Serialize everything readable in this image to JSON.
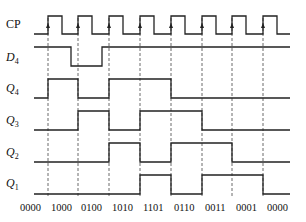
{
  "diagram": {
    "type": "timing",
    "signals": [
      {
        "name": "CP",
        "sub": "",
        "italic": false,
        "y_high": 16,
        "y_low": 34,
        "label_y": 28
      },
      {
        "name": "D",
        "sub": "4",
        "italic": true,
        "y_high": 47,
        "y_low": 66,
        "label_y": 61
      },
      {
        "name": "Q",
        "sub": "4",
        "italic": true,
        "y_high": 79,
        "y_low": 98,
        "label_y": 92
      },
      {
        "name": "Q",
        "sub": "3",
        "italic": true,
        "y_high": 111,
        "y_low": 130,
        "label_y": 124
      },
      {
        "name": "Q",
        "sub": "2",
        "italic": true,
        "y_high": 143,
        "y_low": 162,
        "label_y": 156
      },
      {
        "name": "Q",
        "sub": "1",
        "italic": true,
        "y_high": 175,
        "y_low": 194,
        "label_y": 187
      }
    ],
    "clock_edges_x": [
      48,
      78,
      109,
      140,
      171,
      202,
      232,
      263
    ],
    "pulse_width": 14,
    "x_start": 34,
    "x_end": 290,
    "waveforms": {
      "D4": [
        [
          34,
          1
        ],
        [
          71,
          0
        ],
        [
          102,
          1
        ],
        [
          290,
          1
        ]
      ],
      "Q4": [
        [
          34,
          0
        ],
        [
          48,
          1
        ],
        [
          78,
          0
        ],
        [
          109,
          1
        ],
        [
          171,
          0
        ],
        [
          290,
          0
        ]
      ],
      "Q3": [
        [
          34,
          0
        ],
        [
          78,
          1
        ],
        [
          109,
          0
        ],
        [
          140,
          1
        ],
        [
          202,
          0
        ],
        [
          290,
          0
        ]
      ],
      "Q2": [
        [
          34,
          0
        ],
        [
          109,
          1
        ],
        [
          140,
          0
        ],
        [
          171,
          1
        ],
        [
          232,
          0
        ],
        [
          290,
          0
        ]
      ],
      "Q1": [
        [
          34,
          0
        ],
        [
          140,
          1
        ],
        [
          171,
          0
        ],
        [
          202,
          1
        ],
        [
          263,
          0
        ],
        [
          290,
          0
        ]
      ]
    },
    "states": [
      "0000",
      "1000",
      "0100",
      "1010",
      "1101",
      "0110",
      "0011",
      "0001",
      "0000"
    ],
    "state_x": [
      20,
      51,
      81,
      112,
      143,
      174,
      205,
      236,
      267
    ],
    "state_y": 211
  }
}
